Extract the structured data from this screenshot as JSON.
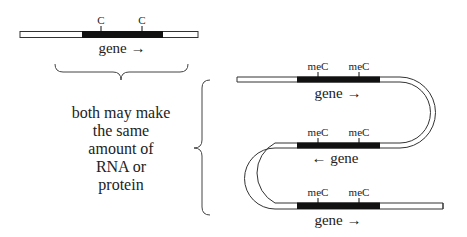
{
  "left": {
    "site_labels": [
      "C",
      "C"
    ],
    "gene_label": "gene →"
  },
  "caption": {
    "lines": [
      "both may make",
      "the same",
      "amount of",
      "RNA or",
      "protein"
    ]
  },
  "right": {
    "strands": [
      {
        "site_labels": [
          "meC",
          "meC"
        ],
        "gene_label": "gene →"
      },
      {
        "site_labels": [
          "meC",
          "meC"
        ],
        "gene_label": "← gene"
      },
      {
        "site_labels": [
          "meC",
          "meC"
        ],
        "gene_label": "gene →"
      }
    ]
  },
  "colors": {
    "gene_fill": "#111111",
    "strand_outline": "#333333",
    "strand_fill": "#ffffff",
    "text": "#222222"
  }
}
